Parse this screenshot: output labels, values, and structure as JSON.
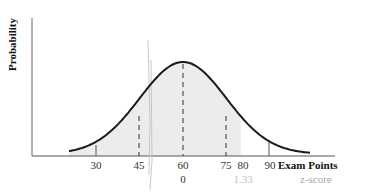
{
  "chart_data": {
    "type": "area",
    "title": "",
    "xlabel": "Exam Points",
    "ylabel": "Probability",
    "secondary_xlabel": "z-score",
    "distribution": "normal",
    "mean": 60,
    "sd": 15,
    "x_ticks": [
      30,
      45,
      60,
      75,
      80,
      90
    ],
    "x_tick_labels": [
      "30",
      "45",
      "60",
      "75",
      "80",
      "90"
    ],
    "z_ticks": [
      {
        "x": 60,
        "z": "0"
      },
      {
        "x": 80,
        "z": "1.33"
      }
    ],
    "dashed_lines_at": [
      45,
      60,
      75
    ],
    "shaded_region": {
      "from": 15,
      "to": 80,
      "label": "P(X < 80)"
    },
    "xlim": [
      15,
      105
    ],
    "grid": false,
    "legend": null
  },
  "labels": {
    "ylabel": "Probability",
    "xlabel": "Exam Points",
    "zlabel": "z-score",
    "ticks": [
      "30",
      "45",
      "60",
      "75",
      "80",
      "90"
    ],
    "z0": "0",
    "z133": "1.33"
  },
  "colors": {
    "curve": "#1a1a1a",
    "shade": "#ececec",
    "axis": "#555555",
    "dash": "#333333",
    "faded_text": "#a8a8a8"
  }
}
